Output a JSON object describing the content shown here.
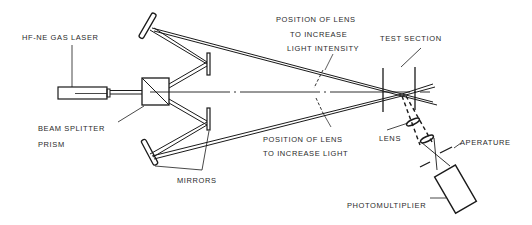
{
  "diagram": {
    "type": "optical-setup",
    "colors": {
      "ink": "#1a1a1a",
      "background": "#ffffff",
      "text": "#2a2a2a"
    },
    "labels": {
      "laser": "HF-NE GAS LASER",
      "beam_splitter_line1": "BEAM SPLITTER",
      "beam_splitter_line2": "PRISM",
      "mirrors": "MIRRORS",
      "lens_upper_line1": "POSITION OF LENS",
      "lens_upper_line2": "TO INCREASE",
      "lens_upper_line3": "LIGHT INTENSITY",
      "lens_lower_line1": "POSITION OF LENS",
      "lens_lower_line2": "TO INCREASE LIGHT",
      "test_section": "TEST SECTION",
      "lens": "LENS",
      "aperture": "APERATURE",
      "photomultiplier": "PHOTOMULTIPLIER"
    },
    "components": [
      {
        "id": "laser",
        "name": "HF-NE Gas Laser"
      },
      {
        "id": "beam-splitter",
        "name": "Beam Splitter Prism"
      },
      {
        "id": "mirror-top-left",
        "name": "Mirror"
      },
      {
        "id": "mirror-upper-small",
        "name": "Mirror"
      },
      {
        "id": "mirror-lower-small",
        "name": "Mirror"
      },
      {
        "id": "mirror-bottom-left",
        "name": "Mirror"
      },
      {
        "id": "test-section",
        "name": "Test Section"
      },
      {
        "id": "lens",
        "name": "Lens"
      },
      {
        "id": "aperture",
        "name": "Aperature"
      },
      {
        "id": "photomultiplier",
        "name": "Photomultiplier"
      }
    ]
  }
}
